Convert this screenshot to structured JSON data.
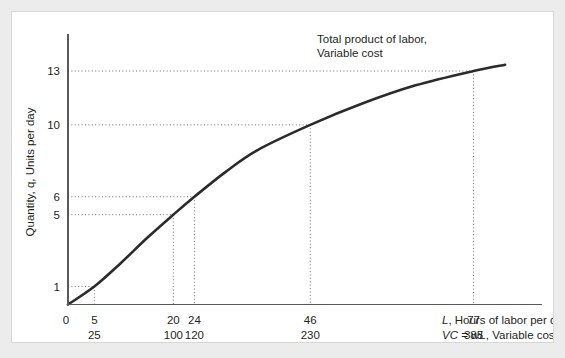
{
  "chart_data": {
    "type": "line",
    "title": "",
    "annotation": {
      "line1": "Total product of labor,",
      "line2": "Variable cost"
    },
    "ylabel": "Quantity, q, Units per day",
    "xlabel_primary": "L, Hours of labor per day",
    "xlabel_secondary": "VC = wL, Variable cost, $",
    "xlabel_secondary_parts": {
      "vc": "VC",
      "equals": " = ",
      "wl": "wL",
      "rest": ", Variable cost, $"
    },
    "xlim": [
      0,
      90
    ],
    "ylim": [
      0,
      14
    ],
    "grid": false,
    "legend": "none",
    "origin_label": "0",
    "yticks": [
      1,
      5,
      6,
      10,
      13
    ],
    "xticks_labor": [
      5,
      20,
      24,
      46,
      77
    ],
    "xticks_cost": [
      25,
      100,
      120,
      230,
      385
    ],
    "marked_points": [
      {
        "L": 5,
        "VC": 25,
        "q": 1
      },
      {
        "L": 20,
        "VC": 100,
        "q": 5
      },
      {
        "L": 24,
        "VC": 120,
        "q": 6
      },
      {
        "L": 46,
        "VC": 230,
        "q": 10
      },
      {
        "L": 77,
        "VC": 385,
        "q": 13
      }
    ],
    "curve_points": [
      {
        "L": 0,
        "q": 0
      },
      {
        "L": 5,
        "q": 1
      },
      {
        "L": 10,
        "q": 2.3
      },
      {
        "L": 15,
        "q": 3.7
      },
      {
        "L": 20,
        "q": 5
      },
      {
        "L": 24,
        "q": 6
      },
      {
        "L": 30,
        "q": 7.4
      },
      {
        "L": 36,
        "q": 8.6
      },
      {
        "L": 46,
        "q": 10
      },
      {
        "L": 56,
        "q": 11.2
      },
      {
        "L": 66,
        "q": 12.2
      },
      {
        "L": 77,
        "q": 13
      },
      {
        "L": 83,
        "q": 13.35
      }
    ],
    "colors": {
      "curve": "#2b2b2d",
      "axis": "#58595b",
      "guide": "#6d6e70",
      "panel_bg": "#ffffff",
      "page_bg": "#ececed"
    }
  }
}
